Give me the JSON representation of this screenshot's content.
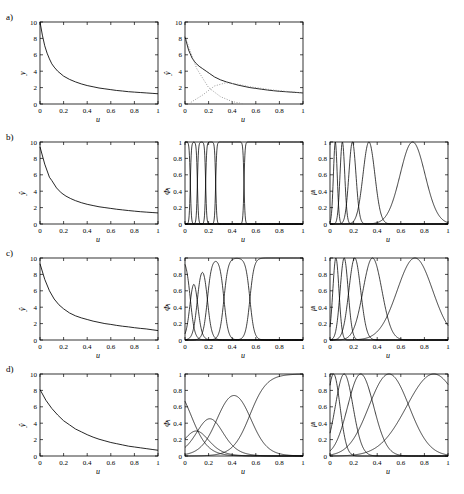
{
  "figure": {
    "rows": [
      {
        "label": "a)"
      },
      {
        "label": "b)"
      },
      {
        "label": "c)"
      },
      {
        "label": "d)"
      }
    ],
    "axis_labels": {
      "x": "u",
      "y_hat": "ŷ",
      "phi": "Φ",
      "mu": "μ",
      "phi_sub": "i",
      "mu_sub": "i",
      "y_plain": "y"
    },
    "xticks": [
      "0",
      "0.2",
      "0.4",
      "0.6",
      "0.8",
      "1"
    ],
    "yticks_y": [
      "0",
      "2",
      "4",
      "6",
      "8",
      "10"
    ],
    "yticks_unit": [
      "0",
      "0.2",
      "0.4",
      "0.6",
      "0.8",
      "1"
    ]
  },
  "chart_data": {
    "type": "line",
    "title": "",
    "xlabel": "u",
    "ylabel": "",
    "xlim": [
      0,
      1
    ],
    "grid": false,
    "legend": "none",
    "panels": [
      {
        "row": "a)",
        "col": 1,
        "ylabel": "y",
        "ylim": [
          0,
          10
        ],
        "series": [
          {
            "name": "y(u)",
            "style": "solid",
            "x": [
              0.0,
              0.02,
              0.04,
              0.06,
              0.08,
              0.1,
              0.12,
              0.15,
              0.2,
              0.25,
              0.3,
              0.35,
              0.4,
              0.45,
              0.5,
              0.55,
              0.6,
              0.65,
              0.7,
              0.75,
              0.8,
              0.85,
              0.9,
              0.95,
              1.0
            ],
            "y": [
              10.0,
              8.4,
              7.1,
              6.2,
              5.5,
              4.9,
              4.5,
              4.0,
              3.4,
              3.0,
              2.7,
              2.45,
              2.25,
              2.1,
              1.95,
              1.85,
              1.75,
              1.65,
              1.58,
              1.5,
              1.45,
              1.4,
              1.35,
              1.3,
              1.25
            ]
          }
        ]
      },
      {
        "row": "a)",
        "col": 2,
        "ylabel": "ŷ",
        "ylim": [
          0,
          10
        ],
        "series": [
          {
            "name": "yhat",
            "style": "solid",
            "x": [
              0.0,
              0.03,
              0.06,
              0.09,
              0.12,
              0.15,
              0.18,
              0.21,
              0.25,
              0.3,
              0.35,
              0.4,
              0.45,
              0.5,
              0.55,
              0.6,
              0.65,
              0.7,
              0.75,
              0.8,
              0.85,
              0.9,
              0.95,
              1.0
            ],
            "y": [
              8.2,
              6.6,
              5.6,
              5.0,
              4.6,
              4.3,
              4.0,
              3.7,
              3.3,
              2.95,
              2.7,
              2.5,
              2.3,
              2.15,
              2.0,
              1.9,
              1.8,
              1.7,
              1.62,
              1.55,
              1.5,
              1.45,
              1.4,
              1.35
            ]
          },
          {
            "name": "local-model-1",
            "style": "dotted",
            "x": [
              0.0,
              0.1,
              0.2,
              0.3,
              0.4,
              0.5
            ],
            "y": [
              8.2,
              4.3,
              2.0,
              0.9,
              0.3,
              0.0
            ]
          },
          {
            "name": "local-model-2",
            "style": "dotted",
            "x": [
              0.05,
              0.15,
              0.25,
              0.35,
              0.45,
              0.55,
              0.65,
              0.75,
              0.85,
              1.0
            ],
            "y": [
              0.2,
              1.1,
              2.2,
              2.6,
              2.4,
              2.1,
              1.9,
              1.7,
              1.55,
              1.35
            ]
          }
        ]
      },
      {
        "row": "b)",
        "col": 1,
        "ylabel": "ŷ",
        "ylim": [
          0,
          10
        ],
        "series": [
          {
            "name": "yhat-piecewise",
            "style": "solid",
            "x": [
              0.0,
              0.04,
              0.08,
              0.1,
              0.14,
              0.18,
              0.22,
              0.26,
              0.3,
              0.35,
              0.4,
              0.45,
              0.5,
              0.55,
              0.6,
              0.65,
              0.7,
              0.75,
              0.8,
              0.85,
              0.9,
              0.95,
              1.0
            ],
            "y": [
              9.4,
              7.3,
              5.7,
              5.3,
              4.4,
              3.8,
              3.4,
              3.1,
              2.85,
              2.6,
              2.4,
              2.25,
              2.1,
              2.0,
              1.9,
              1.8,
              1.72,
              1.64,
              1.57,
              1.5,
              1.45,
              1.4,
              1.35
            ]
          }
        ]
      },
      {
        "row": "b)",
        "col": 2,
        "ylabel": "Φ",
        "ylim": [
          0,
          1
        ],
        "note": "near-binary validity functions, very steep transitions",
        "sharpness": 220,
        "centers": [
          0.045,
          0.105,
          0.175,
          0.26,
          0.5
        ],
        "series": [
          {
            "name": "phi_i",
            "style": "solid"
          }
        ]
      },
      {
        "row": "b)",
        "col": 3,
        "ylabel": "μ",
        "ylim": [
          0,
          1
        ],
        "note": "narrow gaussian membership functions",
        "centers": [
          0.045,
          0.105,
          0.19,
          0.33,
          0.7
        ],
        "widths": [
          0.016,
          0.02,
          0.03,
          0.05,
          0.105
        ],
        "series": [
          {
            "name": "mu_i",
            "style": "solid"
          }
        ]
      },
      {
        "row": "c)",
        "col": 1,
        "ylabel": "ŷ",
        "ylim": [
          0,
          10
        ],
        "series": [
          {
            "name": "yhat-smooth",
            "style": "solid",
            "x": [
              0.0,
              0.04,
              0.08,
              0.12,
              0.16,
              0.2,
              0.25,
              0.3,
              0.35,
              0.4,
              0.45,
              0.5,
              0.55,
              0.6,
              0.65,
              0.7,
              0.75,
              0.8,
              0.85,
              0.9,
              0.95,
              1.0
            ],
            "y": [
              9.3,
              7.4,
              6.0,
              5.0,
              4.3,
              3.8,
              3.3,
              2.95,
              2.7,
              2.5,
              2.3,
              2.15,
              2.0,
              1.9,
              1.78,
              1.68,
              1.6,
              1.5,
              1.42,
              1.35,
              1.25,
              1.15
            ]
          }
        ]
      },
      {
        "row": "c)",
        "col": 2,
        "ylabel": "Φ",
        "ylim": [
          0,
          1
        ],
        "note": "sigmoid validity functions, moderate sharpness",
        "sharpness": 55,
        "centers": [
          0.045,
          0.105,
          0.19,
          0.33,
          0.55
        ],
        "series": [
          {
            "name": "phi_i",
            "style": "solid"
          }
        ]
      },
      {
        "row": "c)",
        "col": 3,
        "ylabel": "μ",
        "ylim": [
          0,
          1
        ],
        "note": "gaussian membership functions, medium width",
        "centers": [
          0.05,
          0.12,
          0.21,
          0.36,
          0.72
        ],
        "widths": [
          0.026,
          0.034,
          0.05,
          0.08,
          0.15
        ],
        "series": [
          {
            "name": "mu_i",
            "style": "solid"
          }
        ]
      },
      {
        "row": "d)",
        "col": 1,
        "ylabel": "ŷ",
        "ylim": [
          0,
          10
        ],
        "series": [
          {
            "name": "yhat-very-smooth",
            "style": "solid",
            "x": [
              0.0,
              0.05,
              0.1,
              0.15,
              0.2,
              0.25,
              0.3,
              0.35,
              0.4,
              0.45,
              0.5,
              0.55,
              0.6,
              0.65,
              0.7,
              0.75,
              0.8,
              0.85,
              0.9,
              0.95,
              1.0
            ],
            "y": [
              8.1,
              6.8,
              5.8,
              5.0,
              4.3,
              3.8,
              3.3,
              2.95,
              2.6,
              2.3,
              2.05,
              1.85,
              1.65,
              1.5,
              1.35,
              1.2,
              1.1,
              1.0,
              0.9,
              0.8,
              0.7
            ]
          }
        ]
      },
      {
        "row": "d)",
        "col": 2,
        "ylabel": "Φ",
        "ylim": [
          0,
          1
        ],
        "note": "broad overlapping validity functions",
        "sharpness": 14,
        "centers": [
          0.05,
          0.14,
          0.28,
          0.55
        ],
        "series": [
          {
            "name": "phi_i",
            "style": "solid"
          }
        ]
      },
      {
        "row": "d)",
        "col": 3,
        "ylabel": "μ",
        "ylim": [
          0,
          1
        ],
        "note": "broad gaussian membership functions",
        "centers": [
          0.03,
          0.12,
          0.26,
          0.5,
          0.88
        ],
        "widths": [
          0.055,
          0.075,
          0.11,
          0.17,
          0.23
        ],
        "series": [
          {
            "name": "mu_i",
            "style": "solid"
          }
        ]
      }
    ]
  }
}
